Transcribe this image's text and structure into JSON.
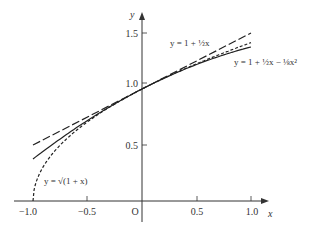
{
  "chart_data": {
    "type": "line",
    "title": "",
    "xlabel": "x",
    "ylabel": "y",
    "origin_label": "O",
    "xlim": [
      -1.1,
      1.15
    ],
    "ylim": [
      0,
      1.6
    ],
    "grid": false,
    "x_ticks": [
      -1.0,
      -0.5,
      0.5,
      1.0
    ],
    "x_tick_labels": [
      "−1.0",
      "−0.5",
      "0.5",
      "1.0"
    ],
    "y_ticks": [
      0.5,
      1.0,
      1.5
    ],
    "y_tick_labels": [
      "0.5",
      "1.0",
      "1.5"
    ],
    "series": [
      {
        "name": "y = √(1 + x)",
        "style": "short-dash",
        "x_range": [
          -1.0,
          1.0
        ],
        "formula": "sqrt(1+x)",
        "values": [
          [
            -1.0,
            0
          ],
          [
            -0.9,
            0.316
          ],
          [
            -0.75,
            0.5
          ],
          [
            -0.5,
            0.707
          ],
          [
            0,
            1.0
          ],
          [
            0.5,
            1.225
          ],
          [
            1.0,
            1.414
          ]
        ]
      },
      {
        "name": "y = 1 + ½x",
        "style": "long-dash",
        "x_range": [
          -1.0,
          1.0
        ],
        "formula": "1+x/2",
        "values": [
          [
            -1.0,
            0.5
          ],
          [
            0,
            1.0
          ],
          [
            1.0,
            1.5
          ]
        ]
      },
      {
        "name": "y = 1 + ½x − ⅛x²",
        "style": "solid",
        "x_range": [
          -1.0,
          1.0
        ],
        "formula": "1+x/2-x^2/8",
        "values": [
          [
            -1.0,
            0.375
          ],
          [
            -0.5,
            0.719
          ],
          [
            0,
            1.0
          ],
          [
            0.5,
            1.219
          ],
          [
            1.0,
            1.375
          ]
        ]
      }
    ],
    "annotations": [
      {
        "text": "y = 1 + ½x",
        "near": [
          0.35,
          1.42
        ]
      },
      {
        "text": "y = 1 + ½x − ⅛x²",
        "near": [
          0.6,
          1.32
        ]
      },
      {
        "text": "y = √(1 + x)",
        "near": [
          -0.9,
          0.2
        ]
      }
    ]
  },
  "labels": {
    "y_axis": "y",
    "x_axis": "x",
    "origin": "O",
    "xt0": "−1.0",
    "xt1": "−0.5",
    "xt2": "0.5",
    "xt3": "1.0",
    "yt0": "0.5",
    "yt1": "1.0",
    "yt2": "1.5",
    "ann_linear": "y = 1 + ½x",
    "ann_quad": "y = 1 + ½x − ⅛x²",
    "ann_sqrt": "y = √(1 + x)"
  }
}
